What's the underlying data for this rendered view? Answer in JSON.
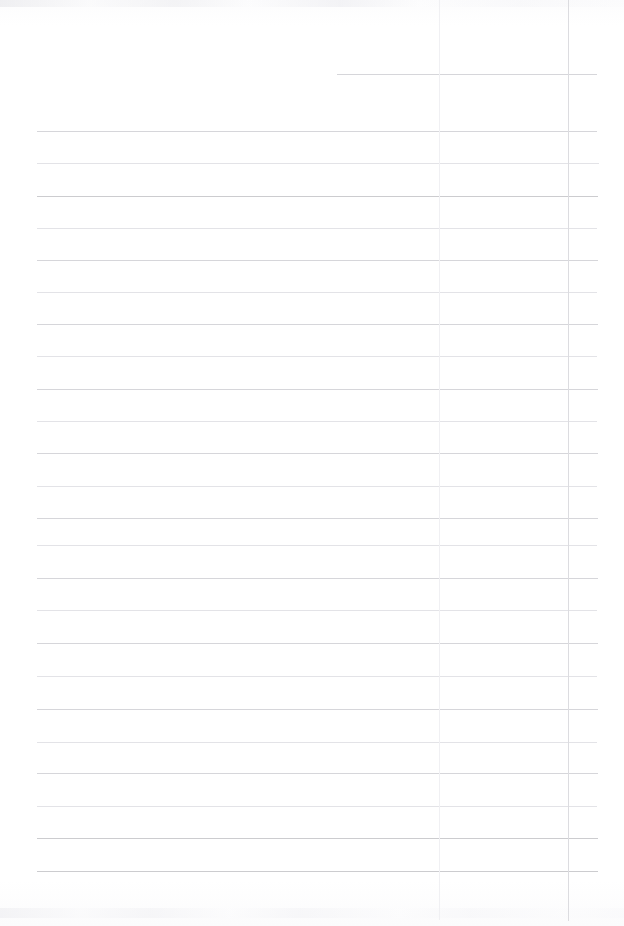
{
  "document": {
    "kind": "scanned-ruled-paper",
    "title": "Blank ruled notebook page (scan)",
    "page_width": 624,
    "page_height": 926,
    "background_color": "#ffffff",
    "content_text": "",
    "has_handwriting": false,
    "has_printed_text": false
  },
  "ruling": {
    "horizontal_line_color": "#d6d6da",
    "horizontal_line_color_faint": "#e3e3e7",
    "horizontal_line_color_strong": "#cccccf",
    "vertical_margin_line_color": "#f0f0f3",
    "vertical_column_line_color": "#dcdce0",
    "line_thickness_px": 1,
    "nominal_line_spacing_px": 32.4,
    "horizontal_line_count": 26,
    "vertical_line_count": 2,
    "default_left_x": 37,
    "default_right_x": 597,
    "horizontal_lines": [
      {
        "y": 74,
        "x1": 337,
        "x2": 597,
        "weight": "normal"
      },
      {
        "y": 131,
        "x1": 37,
        "x2": 597,
        "weight": "normal"
      },
      {
        "y": 163,
        "x1": 37,
        "x2": 599,
        "weight": "faint"
      },
      {
        "y": 196,
        "x1": 37,
        "x2": 598,
        "weight": "strong"
      },
      {
        "y": 228,
        "x1": 37,
        "x2": 597,
        "weight": "faint"
      },
      {
        "y": 260,
        "x1": 37,
        "x2": 598,
        "weight": "normal"
      },
      {
        "y": 292,
        "x1": 37,
        "x2": 597,
        "weight": "faint"
      },
      {
        "y": 324,
        "x1": 37,
        "x2": 598,
        "weight": "normal"
      },
      {
        "y": 356,
        "x1": 37,
        "x2": 597,
        "weight": "faint"
      },
      {
        "y": 389,
        "x1": 37,
        "x2": 598,
        "weight": "normal"
      },
      {
        "y": 421,
        "x1": 37,
        "x2": 597,
        "weight": "faint"
      },
      {
        "y": 453,
        "x1": 37,
        "x2": 598,
        "weight": "normal"
      },
      {
        "y": 486,
        "x1": 37,
        "x2": 597,
        "weight": "faint"
      },
      {
        "y": 518,
        "x1": 37,
        "x2": 598,
        "weight": "normal"
      },
      {
        "y": 545,
        "x1": 37,
        "x2": 597,
        "weight": "faint"
      },
      {
        "y": 578,
        "x1": 37,
        "x2": 598,
        "weight": "normal"
      },
      {
        "y": 610,
        "x1": 37,
        "x2": 597,
        "weight": "faint"
      },
      {
        "y": 643,
        "x1": 37,
        "x2": 598,
        "weight": "normal"
      },
      {
        "y": 676,
        "x1": 37,
        "x2": 597,
        "weight": "faint"
      },
      {
        "y": 709,
        "x1": 37,
        "x2": 598,
        "weight": "normal"
      },
      {
        "y": 742,
        "x1": 37,
        "x2": 597,
        "weight": "faint"
      },
      {
        "y": 773,
        "x1": 37,
        "x2": 598,
        "weight": "normal"
      },
      {
        "y": 806,
        "x1": 37,
        "x2": 597,
        "weight": "faint"
      },
      {
        "y": 838,
        "x1": 37,
        "x2": 598,
        "weight": "strong"
      },
      {
        "y": 871,
        "x1": 37,
        "x2": 598,
        "weight": "strong"
      }
    ],
    "vertical_lines": [
      {
        "x": 439,
        "y1": 0,
        "y2": 920,
        "role": "margin"
      },
      {
        "x": 568,
        "y1": 0,
        "y2": 921,
        "role": "column"
      }
    ]
  }
}
